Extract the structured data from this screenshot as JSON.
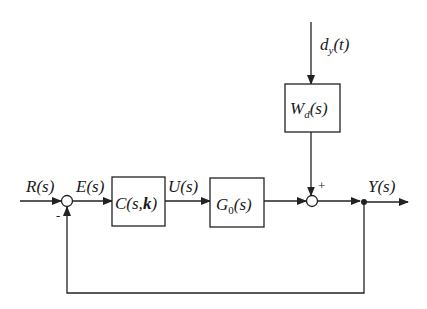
{
  "diagram": {
    "type": "feedback-control-block-diagram",
    "signals": {
      "reference": "R(s)",
      "error": "E(s)",
      "control": "U(s)",
      "output": "Y(s)",
      "disturbance": "d",
      "disturbance_sub": "y",
      "disturbance_arg": "(t)"
    },
    "blocks": {
      "controller": {
        "main": "C(s,",
        "bold": "k",
        "close": ")"
      },
      "plant": {
        "main": "G",
        "sub": "0",
        "arg": "(s)"
      },
      "disturbance_filter": {
        "main": "W",
        "sub": "d",
        "arg": "(s)"
      }
    },
    "junctions": {
      "sum1_sign_feedback": "-",
      "sum2_sign_disturbance": "+"
    },
    "colors": {
      "stroke": "#222222",
      "background": "#ffffff"
    }
  }
}
